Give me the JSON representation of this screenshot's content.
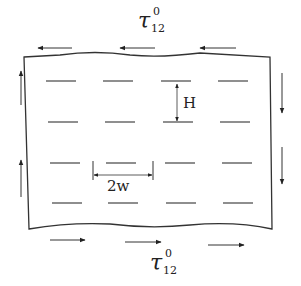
{
  "diagram": {
    "type": "shear-loaded plate with array of cracks",
    "stroke_color": "#333333",
    "background": "#ffffff",
    "labels": {
      "top_load": {
        "symbol": "τ",
        "subscript": "12",
        "superscript": "0"
      },
      "bottom_load": {
        "symbol": "τ",
        "subscript": "12",
        "superscript": "0"
      },
      "crack_spacing": "H",
      "crack_length": "2w"
    },
    "plate": {
      "top_edge_y": 55,
      "bottom_edge_y": 226,
      "left_edge_x": 26,
      "right_edge_x": 270
    },
    "crack_rows": [
      {
        "y": 81,
        "segments": [
          [
            46,
            76
          ],
          [
            103,
            133
          ],
          [
            161,
            191
          ],
          [
            218,
            248
          ]
        ]
      },
      {
        "y": 122,
        "segments": [
          [
            48,
            78
          ],
          [
            105,
            135
          ],
          [
            163,
            193
          ],
          [
            220,
            250
          ]
        ]
      },
      {
        "y": 163,
        "segments": [
          [
            50,
            80
          ],
          [
            106,
            136
          ],
          [
            165,
            195
          ],
          [
            222,
            252
          ]
        ]
      },
      {
        "y": 203,
        "segments": [
          [
            52,
            82
          ],
          [
            108,
            138
          ],
          [
            166,
            196
          ],
          [
            223,
            253
          ]
        ]
      }
    ],
    "shear_arrows": {
      "top": [
        {
          "x1": 72,
          "x2": 38,
          "y": 48
        },
        {
          "x1": 155,
          "x2": 120,
          "y": 48
        },
        {
          "x1": 236,
          "x2": 200,
          "y": 48
        }
      ],
      "bottom": [
        {
          "x1": 50,
          "x2": 85,
          "y": 240
        },
        {
          "x1": 125,
          "x2": 161,
          "y": 242
        },
        {
          "x1": 208,
          "x2": 244,
          "y": 245
        }
      ],
      "left": [
        {
          "x": 21,
          "y1": 105,
          "y2": 71
        },
        {
          "x": 21,
          "y1": 197,
          "y2": 160
        }
      ],
      "right": [
        {
          "x": 282,
          "y1": 73,
          "y2": 113
        },
        {
          "x": 282,
          "y1": 147,
          "y2": 184
        }
      ]
    }
  }
}
